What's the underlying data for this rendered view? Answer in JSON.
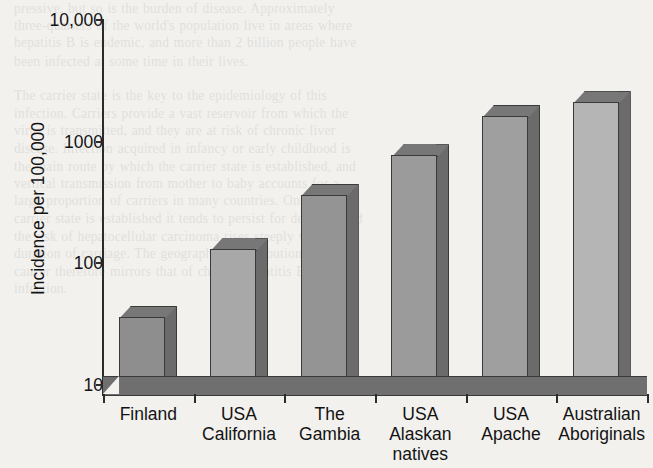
{
  "chart_data": {
    "type": "bar",
    "title": "",
    "xlabel": "",
    "ylabel": "Incidence per 100,000",
    "yscale": "log",
    "ylim": [
      10,
      10000
    ],
    "ytick_labels": [
      "10,000",
      "1000",
      "100",
      "10"
    ],
    "ytick_values": [
      10000,
      1000,
      100,
      10
    ],
    "grid": false,
    "legend": "none",
    "categories": [
      "Finland",
      "USA California",
      "The Gambia",
      "USA Alaskan natives",
      "USA Apache",
      "Australian Aboriginals"
    ],
    "category_lines": [
      [
        "Finland"
      ],
      [
        "USA",
        "California"
      ],
      [
        "The",
        "Gambia"
      ],
      [
        "USA",
        "Alaskan",
        "natives"
      ],
      [
        "USA",
        "Apache"
      ],
      [
        "Australian",
        "Aboriginals"
      ]
    ],
    "values": [
      45,
      160,
      450,
      950,
      2000,
      2600
    ],
    "bar_colors": [
      "#8e8e8e",
      "#a8a8a8",
      "#949494",
      "#9b9b9b",
      "#9f9f9f",
      "#b5b5b5"
    ],
    "style": "3d-columns"
  },
  "axes": {
    "y_label": "Incidence per 100,000",
    "y_ticks": [
      {
        "label": "10,000",
        "value": 10000
      },
      {
        "label": "1000",
        "value": 1000
      },
      {
        "label": "100",
        "value": 100
      },
      {
        "label": "10",
        "value": 10
      }
    ]
  },
  "background_text": "pressive, but so is the burden of disease. Approximately\nthree-quarters of the world's population live in areas where\nhepatitis B is endemic, and more than 2 billion people have\nbeen infected at some time in their lives.\n\nThe carrier state is the key to the epidemiology of this\ninfection. Carriers provide a vast reservoir from which the\nvirus is transmitted, and they are at risk of chronic liver\ndisease. Infection acquired in infancy or early childhood is\nthe main route by which the carrier state is established, and\nvertical transmission from mother to baby accounts for a\nlarge proportion of carriers in many countries. Once the\ncarrier state is established it tends to persist for decades, and\nthe risk of hepatocellular carcinoma rises steeply with the\nduration of carriage. The geographical distribution of liver\ncancer therefore mirrors that of chronic hepatitis B\ninfection."
}
